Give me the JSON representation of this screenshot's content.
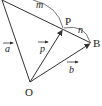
{
  "diagram": {
    "type": "vector-geometry",
    "points": {
      "O": {
        "label": "O",
        "x": 30,
        "y": 82
      },
      "P": {
        "label": "P",
        "x": 63,
        "y": 29
      },
      "B": {
        "label": "B",
        "x": 91,
        "y": 43
      },
      "A": {
        "x": 2,
        "y": 0
      }
    },
    "vectors": [
      {
        "name": "a",
        "label": "a",
        "from": "O",
        "to": "A"
      },
      {
        "name": "p",
        "label": "p",
        "from": "O",
        "to": "P"
      },
      {
        "name": "b",
        "label": "b",
        "from": "O",
        "to": "B"
      }
    ],
    "segments": [
      {
        "from": "A",
        "to": "B",
        "through": "P"
      }
    ],
    "arcs": [
      {
        "label": "m",
        "description": "arc spanning A to P"
      },
      {
        "label": "n",
        "description": "arc spanning P to B"
      }
    ],
    "colors": {
      "stroke": "#333333",
      "text": "#222222",
      "background": "#ffffff"
    }
  }
}
